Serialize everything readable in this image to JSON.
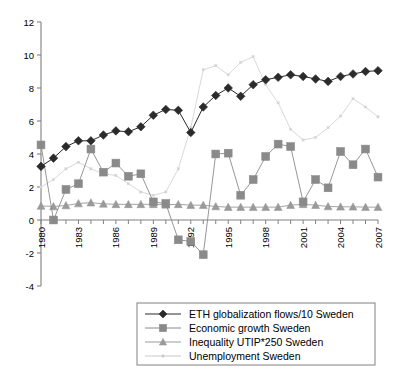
{
  "chart_data": {
    "type": "line",
    "title": "",
    "xlabel": "",
    "ylabel": "",
    "xlim": [
      1980,
      2007
    ],
    "ylim": [
      -4,
      12
    ],
    "ytick_labels": [
      "12",
      "10",
      "8",
      "6",
      "4",
      "2",
      "0",
      "-2",
      "-4"
    ],
    "ytick_values": [
      12,
      10,
      8,
      6,
      4,
      2,
      0,
      -2,
      -4
    ],
    "xtick_labels": [
      "1980",
      "1983",
      "1986",
      "1989",
      "1992",
      "1995",
      "1998",
      "2001",
      "2004",
      "2007"
    ],
    "xtick_values": [
      1980,
      1983,
      1986,
      1989,
      1992,
      1995,
      1998,
      2001,
      2004,
      2007
    ],
    "grid": false,
    "legend_position": "bottom",
    "x": [
      1980,
      1981,
      1982,
      1983,
      1984,
      1985,
      1986,
      1987,
      1988,
      1989,
      1990,
      1991,
      1992,
      1993,
      1994,
      1995,
      1996,
      1997,
      1998,
      1999,
      2000,
      2001,
      2002,
      2003,
      2004,
      2005,
      2006,
      2007
    ],
    "series": [
      {
        "name": "ETH globalization flows/10 Sweden",
        "marker": "diamond",
        "color": "#2b2b2b",
        "values": [
          3.25,
          3.75,
          4.45,
          4.8,
          4.8,
          5.15,
          5.4,
          5.35,
          5.65,
          6.35,
          6.7,
          6.65,
          5.3,
          6.85,
          7.55,
          8.0,
          7.5,
          8.2,
          8.5,
          8.65,
          8.8,
          8.7,
          8.55,
          8.4,
          8.7,
          8.85,
          9.0,
          9.05
        ]
      },
      {
        "name": "Economic growth Sweden",
        "marker": "square",
        "color": "#8a8a8a",
        "values": [
          4.55,
          0.0,
          1.85,
          2.2,
          4.3,
          2.9,
          3.45,
          2.65,
          2.8,
          1.1,
          1.0,
          -1.2,
          -1.3,
          -2.1,
          4.0,
          4.05,
          1.5,
          2.45,
          3.85,
          4.6,
          4.45,
          1.1,
          2.45,
          1.95,
          4.15,
          3.35,
          4.3,
          2.6
        ]
      },
      {
        "name": "Inequality UTIP*250 Sweden",
        "marker": "triangle",
        "color": "#9a9a9a",
        "values": [
          0.85,
          0.82,
          0.88,
          1.0,
          1.05,
          0.98,
          0.95,
          0.95,
          0.95,
          0.95,
          0.92,
          0.95,
          0.9,
          0.9,
          0.82,
          0.78,
          0.78,
          0.78,
          0.78,
          0.78,
          0.9,
          0.95,
          0.9,
          0.82,
          0.8,
          0.8,
          0.78,
          0.78
        ]
      },
      {
        "name": "Unemployment Sweden",
        "marker": "dot",
        "color": "#d4d4d4",
        "values": [
          2.0,
          2.45,
          3.1,
          3.5,
          3.1,
          2.8,
          2.7,
          2.2,
          1.7,
          1.5,
          1.7,
          3.1,
          5.6,
          9.1,
          9.35,
          8.8,
          9.55,
          9.9,
          8.2,
          7.1,
          5.5,
          4.85,
          5.0,
          5.6,
          6.3,
          7.35,
          6.85,
          6.25
        ]
      }
    ]
  },
  "legend": {
    "items": [
      {
        "label": "ETH globalization flows/10 Sweden",
        "marker": "diamond",
        "color": "#2b2b2b"
      },
      {
        "label": "Economic growth Sweden",
        "marker": "square",
        "color": "#8a8a8a"
      },
      {
        "label": "Inequality UTIP*250 Sweden",
        "marker": "triangle",
        "color": "#9a9a9a"
      },
      {
        "label": "Unemployment Sweden",
        "marker": "dot",
        "color": "#c9c9c9"
      }
    ]
  },
  "axis": {
    "line_color": "#808080",
    "text_color": "#000000"
  }
}
